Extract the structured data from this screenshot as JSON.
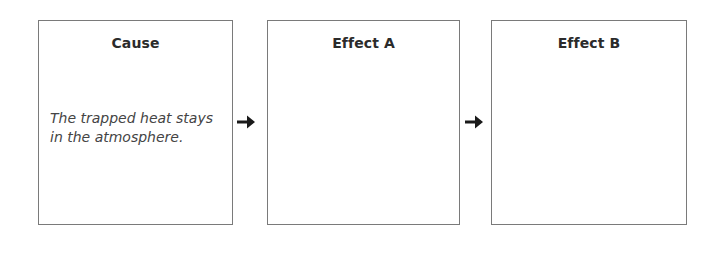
{
  "diagram": {
    "type": "cause-effect-flow",
    "boxes": [
      {
        "title": "Cause",
        "body": "The trapped heat stays in the atmosphere."
      },
      {
        "title": "Effect A",
        "body": ""
      },
      {
        "title": "Effect B",
        "body": ""
      }
    ],
    "arrows": [
      {
        "from": "Cause",
        "to": "Effect A",
        "icon": "right-arrow-icon"
      },
      {
        "from": "Effect A",
        "to": "Effect B",
        "icon": "right-arrow-icon"
      }
    ],
    "colors": {
      "border": "#7a7a7a",
      "title": "#2b2b2b",
      "body_text": "#444444",
      "arrow": "#1a1a1a"
    }
  }
}
